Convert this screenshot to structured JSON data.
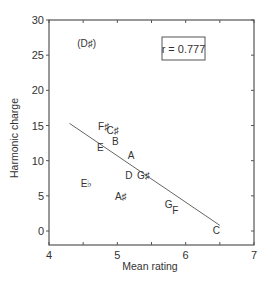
{
  "chart_data": {
    "type": "scatter",
    "title": "",
    "xlabel": "Mean rating",
    "ylabel": "Harmonic charge",
    "xlim": [
      4,
      7
    ],
    "ylim": [
      -2,
      30
    ],
    "x_ticks": [
      4,
      5,
      6,
      7
    ],
    "y_ticks": [
      0,
      5,
      10,
      15,
      20,
      25,
      30
    ],
    "grid": false,
    "legend": null,
    "annotation": "r = 0.777",
    "points": [
      {
        "label": "(D♯)",
        "x": 4.55,
        "y": 26.7,
        "note": "outlier, parenthesized"
      },
      {
        "label": "F♯",
        "x": 4.8,
        "y": 15.0
      },
      {
        "label": "C♯",
        "x": 4.93,
        "y": 14.3
      },
      {
        "label": "B",
        "x": 4.97,
        "y": 12.8
      },
      {
        "label": "E",
        "x": 4.75,
        "y": 12.0
      },
      {
        "label": "A",
        "x": 5.2,
        "y": 10.8
      },
      {
        "label": "D",
        "x": 5.17,
        "y": 8.0
      },
      {
        "label": "G♯",
        "x": 5.38,
        "y": 8.0
      },
      {
        "label": "E♭",
        "x": 4.55,
        "y": 6.8
      },
      {
        "label": "A♯",
        "x": 5.05,
        "y": 5.0
      },
      {
        "label": "G",
        "x": 5.75,
        "y": 3.8
      },
      {
        "label": "F",
        "x": 5.85,
        "y": 3.0
      },
      {
        "label": "C",
        "x": 6.45,
        "y": 0.1
      }
    ],
    "regression_line": {
      "x1": 4.3,
      "y1": 15.3,
      "x2": 6.5,
      "y2": 0.8
    }
  },
  "labels": {
    "xlabel": "Mean rating",
    "ylabel": "Harmonic charge",
    "r_value": "r = 0.777"
  },
  "colors": {
    "axis": "#555555",
    "text": "#333333",
    "line": "#666666"
  }
}
